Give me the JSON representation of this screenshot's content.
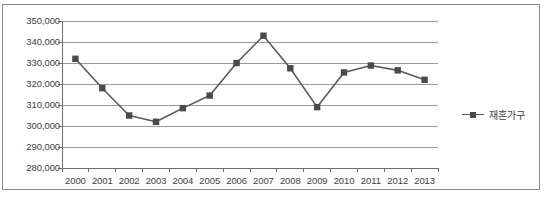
{
  "chart_data": {
    "type": "line",
    "title": "",
    "xlabel": "",
    "ylabel": "",
    "categories": [
      "2000",
      "2001",
      "2002",
      "2003",
      "2004",
      "2005",
      "2006",
      "2007",
      "2008",
      "2009",
      "2010",
      "2011",
      "2012",
      "2013"
    ],
    "series": [
      {
        "name": "재혼가구",
        "marker": "square",
        "color": "#4a4a4a",
        "values": [
          332000,
          318000,
          305000,
          302000,
          308500,
          314500,
          330000,
          343000,
          327500,
          309000,
          325500,
          328800,
          326500,
          322000
        ]
      }
    ],
    "ylim": [
      280000,
      350000
    ],
    "ytick_labels": [
      "350,000",
      "340,000",
      "330,000",
      "320,000",
      "310,000",
      "300,000",
      "290,000",
      "280,000"
    ],
    "ytick_values": [
      350000,
      340000,
      330000,
      320000,
      310000,
      300000,
      290000,
      280000
    ],
    "grid": true,
    "grid_axis": "y",
    "legend_position": "right",
    "legend_entries": [
      "재혼가구"
    ]
  },
  "style": {
    "line_color": "#5a5a5a",
    "marker_color": "#4a4a4a",
    "grid_color": "#9a9a9a",
    "axis_color": "#6e6e6e",
    "border_color": "#8c8c8c",
    "background": "#ffffff"
  }
}
